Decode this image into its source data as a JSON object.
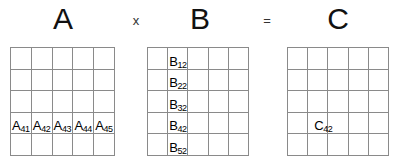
{
  "header": {
    "matrix_a_label": "A",
    "operator_multiply": "x",
    "matrix_b_label": "B",
    "operator_equals": "=",
    "matrix_c_label": "C"
  },
  "colors": {
    "grid_line": "#8a8a8a",
    "text": "#000000",
    "background": "#ffffff"
  },
  "matrices": {
    "a": {
      "name": "A",
      "rows": 5,
      "cols": 5,
      "highlighted_row": 4,
      "labels": [
        {
          "row": 4,
          "col": 1,
          "base": "A",
          "sub": "41"
        },
        {
          "row": 4,
          "col": 2,
          "base": "A",
          "sub": "42"
        },
        {
          "row": 4,
          "col": 3,
          "base": "A",
          "sub": "43"
        },
        {
          "row": 4,
          "col": 4,
          "base": "A",
          "sub": "44"
        },
        {
          "row": 4,
          "col": 5,
          "base": "A",
          "sub": "45"
        }
      ]
    },
    "b": {
      "name": "B",
      "rows": 5,
      "cols": 5,
      "highlighted_col": 2,
      "labels": [
        {
          "row": 1,
          "col": 2,
          "base": "B",
          "sub": "12"
        },
        {
          "row": 2,
          "col": 2,
          "base": "B",
          "sub": "22"
        },
        {
          "row": 3,
          "col": 2,
          "base": "B",
          "sub": "32"
        },
        {
          "row": 4,
          "col": 2,
          "base": "B",
          "sub": "42"
        },
        {
          "row": 5,
          "col": 2,
          "base": "B",
          "sub": "52"
        }
      ]
    },
    "c": {
      "name": "C",
      "rows": 5,
      "cols": 5,
      "labels": [
        {
          "row": 4,
          "col": 2,
          "base": "C",
          "sub": "42"
        }
      ]
    }
  }
}
